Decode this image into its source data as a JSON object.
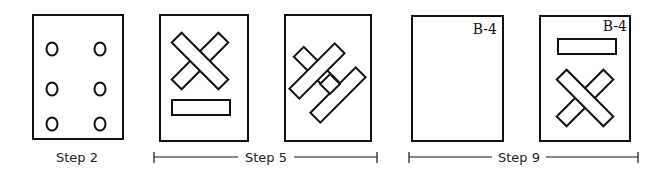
{
  "steps": [
    {
      "label": "Step 2",
      "panels": 1
    },
    {
      "label": "Step 5",
      "panels": 2
    },
    {
      "label": "Step 9",
      "panels": 2
    }
  ],
  "panel_tags": {
    "step9_panel1": "B-4",
    "step9_panel2": "B-4"
  },
  "colors": {
    "stroke": "#111111",
    "background": "#ffffff"
  }
}
